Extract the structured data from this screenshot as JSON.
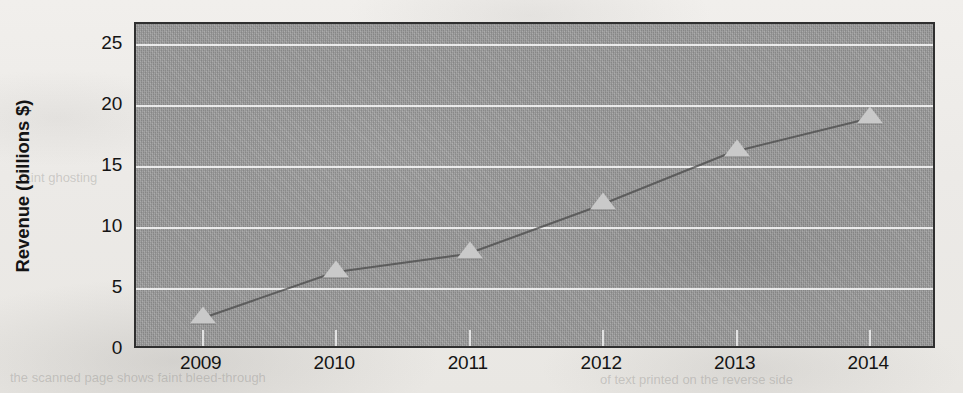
{
  "chart_data": {
    "type": "line",
    "title": "",
    "subtitle": "",
    "xlabel": "",
    "ylabel": "Revenue (billions $)",
    "categories": [
      "2009",
      "2010",
      "2011",
      "2012",
      "2013",
      "2014"
    ],
    "values": [
      2.7,
      6.5,
      8.0,
      12.0,
      16.4,
      19.1
    ],
    "series": [
      {
        "name": "Revenue",
        "values": [
          2.7,
          6.5,
          8.0,
          12.0,
          16.4,
          19.1
        ]
      }
    ],
    "ylim": [
      0,
      26.7
    ],
    "yticks": [
      0,
      5,
      10,
      15,
      20,
      25
    ],
    "ytick_labels": [
      "0",
      "5",
      "10",
      "15",
      "20",
      "25"
    ],
    "grid": true,
    "grid_axis": "y",
    "legend": false,
    "legend_position": "none",
    "marker": "triangle",
    "colors": {
      "plot_background": "#9a9a9a",
      "gridline": "#ffffff",
      "marker": "#c9c9c9",
      "line": "#4a4a4a",
      "axis_border": "#2f2f2f",
      "text": "#141414",
      "page_background": "#eeece9"
    }
  },
  "ghosts": [
    {
      "text": "the scanned page shows faint bleed-through",
      "left": 10,
      "top": 370
    },
    {
      "text": "of text printed on the reverse side",
      "left": 600,
      "top": 372
    },
    {
      "text": "faint ghosting",
      "left": 20,
      "top": 170
    }
  ]
}
